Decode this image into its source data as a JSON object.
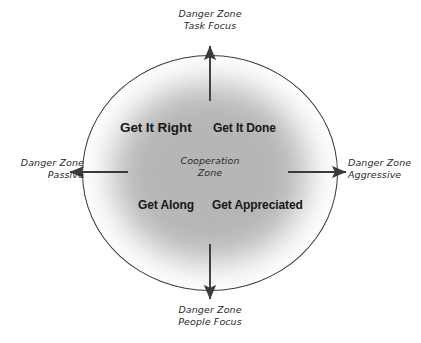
{
  "diagram": {
    "center_label": {
      "line1": "Cooperation",
      "line2": "Zone"
    },
    "outer_labels": [
      {
        "id": "top",
        "line1": "Danger Zone",
        "line2": "Task Focus",
        "direction": "up"
      },
      {
        "id": "right",
        "line1": "Danger Zone",
        "line2": "Aggressive",
        "direction": "right"
      },
      {
        "id": "bottom",
        "line1": "Danger Zone",
        "line2": "People Focus",
        "direction": "down"
      },
      {
        "id": "left",
        "line1": "Danger Zone",
        "line2": "Passive",
        "direction": "left"
      }
    ],
    "quadrants": [
      {
        "id": "top-left",
        "label": "Get It Right"
      },
      {
        "id": "top-right",
        "label": "Get It Done"
      },
      {
        "id": "bottom-left",
        "label": "Get Along"
      },
      {
        "id": "bottom-right",
        "label": "Get Appreciated"
      }
    ],
    "colors": {
      "background": "#ffffff",
      "circle_stroke": "#3a3a3a",
      "core_fill": "#b6b6b6",
      "arrow": "#3a3a3a",
      "text": "#171717",
      "script_text": "#2b2b2b"
    }
  }
}
